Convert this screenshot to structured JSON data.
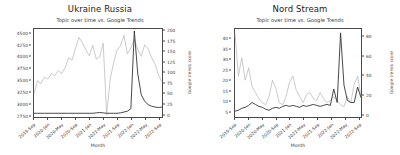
{
  "figure": {
    "background": "#ffffff",
    "panel_count": 2
  },
  "chart_data": [
    {
      "type": "line",
      "title": "Ukraine Russia",
      "subtitle": "Topic over time vs. Google Trends",
      "xlabel": "Month",
      "ylabel": "",
      "y2label": "Google trends score",
      "grid": false,
      "legend": "none",
      "x": [
        "2019-Sep",
        "2019-Oct",
        "2019-Nov",
        "2019-Dec",
        "2020-Jan",
        "2020-Feb",
        "2020-Mar",
        "2020-Apr",
        "2020-May",
        "2020-Jun",
        "2020-Jul",
        "2020-Aug",
        "2020-Sep",
        "2020-Oct",
        "2020-Nov",
        "2020-Dec",
        "2021-Jan",
        "2021-Feb",
        "2021-Mar",
        "2021-Apr",
        "2021-May",
        "2021-Jun",
        "2021-Jul",
        "2021-Aug",
        "2021-Sep",
        "2021-Oct",
        "2021-Nov",
        "2021-Dec",
        "2022-Jan",
        "2022-Feb",
        "2022-Mar",
        "2022-Apr",
        "2022-May",
        "2022-Jun",
        "2022-Jul",
        "2022-Aug",
        "2022-Sep",
        "2022-Oct"
      ],
      "xticklabels": [
        "2019-Sep",
        "2020-Jan",
        "2020-May",
        "2020-Sep",
        "2021-Jan",
        "2021-May",
        "2021-Sep",
        "2022-Jan",
        "2022-May",
        "2022-Sep"
      ],
      "xtick_positions": [
        0,
        4,
        8,
        12,
        16,
        20,
        24,
        28,
        32,
        36
      ],
      "ylim": [
        2700,
        4600
      ],
      "yticks": [
        2750,
        3000,
        3250,
        3500,
        3750,
        4000,
        4250,
        4500
      ],
      "y2lim": [
        -8,
        205
      ],
      "y2ticks": [
        0,
        25,
        50,
        75,
        100,
        125,
        150,
        175,
        200
      ],
      "series": [
        {
          "name": "Frequency",
          "axis": "left",
          "color": "#b4b4b4",
          "values": [
            3200,
            3480,
            3420,
            3560,
            3520,
            3640,
            3590,
            3700,
            3640,
            3760,
            3980,
            3930,
            4180,
            4420,
            4300,
            4150,
            4020,
            4250,
            3950,
            4000,
            4290,
            2750,
            3500,
            3870,
            4140,
            4240,
            4460,
            4060,
            4190,
            4380,
            4160,
            4010,
            4260,
            4170,
            3980,
            3840,
            3600,
            3460
          ]
        },
        {
          "name": "Google trends score",
          "axis": "right",
          "color": "#343434",
          "values": [
            1,
            1,
            1,
            1,
            1,
            1,
            1,
            1,
            1,
            1,
            1,
            1,
            1,
            1,
            1,
            1,
            1,
            1,
            2,
            3,
            2,
            1,
            1,
            1,
            1,
            2,
            4,
            6,
            12,
            200,
            96,
            46,
            30,
            22,
            18,
            16,
            15,
            16
          ]
        }
      ]
    },
    {
      "type": "line",
      "title": "Nord Stream",
      "subtitle": "Topic over time vs. Google Trends",
      "xlabel": "Month",
      "ylabel": "",
      "y2label": "Google trends score",
      "grid": false,
      "legend": "none",
      "x": [
        "2019-Sep",
        "2019-Oct",
        "2019-Nov",
        "2019-Dec",
        "2020-Jan",
        "2020-Feb",
        "2020-Mar",
        "2020-Apr",
        "2020-May",
        "2020-Jun",
        "2020-Jul",
        "2020-Aug",
        "2020-Sep",
        "2020-Oct",
        "2020-Nov",
        "2020-Dec",
        "2021-Jan",
        "2021-Feb",
        "2021-Mar",
        "2021-Apr",
        "2021-May",
        "2021-Jun",
        "2021-Jul",
        "2021-Aug",
        "2021-Sep",
        "2021-Oct",
        "2021-Nov",
        "2021-Dec",
        "2022-Jan",
        "2022-Feb",
        "2022-Mar",
        "2022-Apr",
        "2022-May",
        "2022-Jun",
        "2022-Jul",
        "2022-Aug",
        "2022-Sep",
        "2022-Oct"
      ],
      "xticklabels": [
        "2019-Sep",
        "2020-Jan",
        "2020-May",
        "2020-Sep",
        "2021-Jan",
        "2021-May",
        "2021-Sep",
        "2022-Jan",
        "2022-May",
        "2022-Sep"
      ],
      "xtick_positions": [
        0,
        4,
        8,
        12,
        16,
        20,
        24,
        28,
        32,
        36
      ],
      "ylim": [
        2,
        45
      ],
      "yticks": [
        5,
        10,
        15,
        20,
        25,
        30,
        35,
        40
      ],
      "y2lim": [
        -3,
        88
      ],
      "y2ticks": [
        0,
        20,
        40,
        60,
        80
      ],
      "series": [
        {
          "name": "Frequency",
          "axis": "left",
          "color": "#b4b4b4",
          "values": [
            43,
            22,
            31,
            20,
            26,
            17,
            14,
            11,
            9,
            8,
            12,
            20,
            16,
            9,
            8,
            12,
            19,
            22,
            15,
            12,
            9,
            13,
            14,
            11,
            10,
            14,
            11,
            9,
            10,
            12,
            10,
            8,
            7,
            12,
            9,
            18,
            22,
            12
          ]
        },
        {
          "name": "Google trends score",
          "axis": "right",
          "color": "#343434",
          "values": [
            3,
            4,
            6,
            7,
            9,
            12,
            10,
            8,
            7,
            5,
            4,
            6,
            7,
            6,
            8,
            9,
            8,
            9,
            8,
            7,
            9,
            8,
            9,
            10,
            9,
            8,
            9,
            10,
            9,
            26,
            12,
            84,
            30,
            14,
            12,
            12,
            28,
            17
          ]
        }
      ]
    }
  ]
}
